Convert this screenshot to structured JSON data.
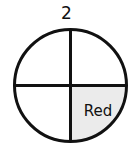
{
  "spinner": {
    "title": "2",
    "sections": 4,
    "shaded_sections": [
      {
        "position": "bottom-right",
        "label": "Red",
        "fill": "#ebebeb"
      }
    ],
    "unlabeled_sections": [
      "top-left",
      "top-right",
      "bottom-left"
    ],
    "outline_color": "#111111",
    "background_color": "#ffffff"
  }
}
